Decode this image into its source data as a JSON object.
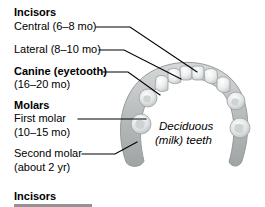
{
  "figure": {
    "background_color": "#ffffff",
    "line_color": "#000000",
    "gum_color": "#b9bcbd",
    "tooth_color": "#eef0f0"
  },
  "labels": {
    "incisors_heading": "Incisors",
    "central": "Central (6–8 mo)",
    "lateral": "Lateral (8–10 mo)",
    "canine": "Canine (eyetooth)",
    "canine_age": "(16–20 mo)",
    "molars_heading": "Molars",
    "first_molar": "First molar",
    "first_molar_age": "(10–15 mo)",
    "second_molar": "Second molar",
    "second_molar_age": "(about 2 yr)",
    "incisors_heading_repeat": "Incisors"
  },
  "caption": {
    "line1": "Deciduous",
    "line2": "(milk) teeth"
  },
  "leader_lines": [
    {
      "name": "central-leader",
      "points": "96,27 130,27 197,72"
    },
    {
      "name": "lateral-leader",
      "points": "99,50 124,50 180,80"
    },
    {
      "name": "canine-leader",
      "points": "103,72 128,72 159,96"
    },
    {
      "name": "first-molar-leader",
      "points": "78,119 145,119 148,122"
    },
    {
      "name": "second-molar-leader",
      "points": "82,154 116,154 140,144"
    }
  ]
}
